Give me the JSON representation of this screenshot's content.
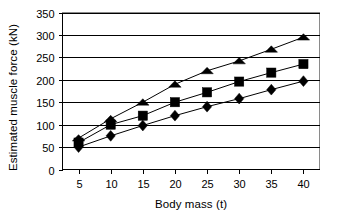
{
  "chart_data": {
    "type": "line",
    "title": "",
    "xlabel": "Body mass (t)",
    "ylabel": "Estimated muscle force (kN)",
    "x": [
      5,
      10,
      15,
      20,
      25,
      30,
      35,
      40
    ],
    "xticks": [
      "5",
      "10",
      "15",
      "20",
      "25",
      "30",
      "35",
      "40"
    ],
    "yticks": [
      "0",
      "50",
      "100",
      "150",
      "200",
      "250",
      "300",
      "350"
    ],
    "xlim": [
      2.5,
      42.5
    ],
    "ylim": [
      0,
      350
    ],
    "grid": "horizontal",
    "legend": "none",
    "series": [
      {
        "name": "triangle-series",
        "marker": "triangle",
        "color": "#000000",
        "values": [
          70,
          113,
          150,
          190,
          220,
          242,
          268,
          295
        ]
      },
      {
        "name": "square-series",
        "marker": "square",
        "color": "#000000",
        "values": [
          60,
          100,
          120,
          150,
          172,
          196,
          216,
          235
        ]
      },
      {
        "name": "diamond-series",
        "marker": "diamond",
        "color": "#000000",
        "values": [
          50,
          75,
          98,
          120,
          140,
          158,
          178,
          197
        ]
      }
    ]
  }
}
